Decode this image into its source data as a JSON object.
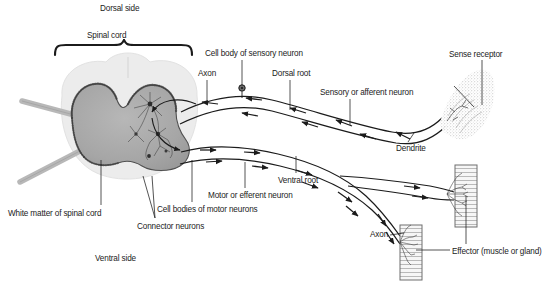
{
  "figure": {
    "type": "biological-diagram",
    "palette": {
      "background": "#ffffff",
      "gray_matter": "#a9a9a9",
      "gray_matter_edge": "#5a5a5a",
      "white_matter": "#ececec",
      "nerve_line": "#1b1b1b",
      "text": "#1b1b1b",
      "muscle_fill": "#f2f2f2",
      "receptor_stipple": "#8f8f8f"
    }
  },
  "labels": {
    "dorsal_side": "Dorsal side",
    "spinal_cord": "Spinal cord",
    "axon_sensory": "Axon",
    "cell_body_sensory": "Cell body of sensory neuron",
    "dorsal_root": "Dorsal root",
    "sensory_neuron": "Sensory or afferent neuron",
    "sense_receptor": "Sense receptor",
    "dendrite": "Dendrite",
    "white_matter": "White matter of spinal cord",
    "connector_neurons": "Connector neurons",
    "cell_bodies_motor": "Cell bodies of motor neurons",
    "motor_neuron": "Motor or efferent neuron",
    "ventral_root": "Ventral root",
    "ventral_side": "Ventral side",
    "axon_motor": "Axon",
    "effector": "Effector (muscle or gland)"
  },
  "label_positions": {
    "dorsal_side": {
      "x": 100,
      "y": 5
    },
    "spinal_cord": {
      "x": 87,
      "y": 32
    },
    "axon_sensory": {
      "x": 198,
      "y": 70
    },
    "cell_body_sensory": {
      "x": 205,
      "y": 50
    },
    "dorsal_root": {
      "x": 272,
      "y": 70
    },
    "sensory_neuron": {
      "x": 320,
      "y": 89
    },
    "sense_receptor": {
      "x": 449,
      "y": 51
    },
    "dendrite": {
      "x": 396,
      "y": 145
    },
    "white_matter": {
      "x": 8,
      "y": 210
    },
    "connector_neurons": {
      "x": 137,
      "y": 223
    },
    "cell_bodies_motor": {
      "x": 157,
      "y": 206
    },
    "motor_neuron": {
      "x": 208,
      "y": 192
    },
    "ventral_root": {
      "x": 278,
      "y": 177
    },
    "ventral_side": {
      "x": 95,
      "y": 255
    },
    "axon_motor": {
      "x": 370,
      "y": 231
    },
    "effector": {
      "x": 452,
      "y": 248
    }
  },
  "arrow_flow": {
    "sensory_direction": "toward spinal cord (right to left)",
    "motor_direction": "away from spinal cord (left to right)"
  }
}
